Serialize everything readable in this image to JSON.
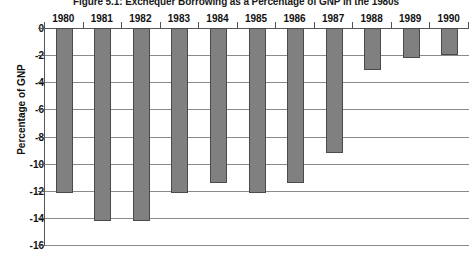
{
  "chart_data": {
    "type": "bar",
    "title": "Figure 5.1: Exchequer Borrowing as a Percentage of GNP in the 1980s",
    "xlabel": "",
    "ylabel": "Percentage of GNP",
    "categories": [
      "1980",
      "1981",
      "1982",
      "1983",
      "1984",
      "1985",
      "1986",
      "1987",
      "1988",
      "1989",
      "1990"
    ],
    "values": [
      -12.2,
      -14.2,
      -14.2,
      -12.2,
      -11.4,
      -12.2,
      -11.4,
      -9.2,
      -3.1,
      -2.2,
      -2.0
    ],
    "ylim": [
      -16,
      0
    ],
    "ytick_labels": [
      "0",
      "-2",
      "-4",
      "-6",
      "-8",
      "-10",
      "-12",
      "-14",
      "-16"
    ],
    "ytick_values": [
      0,
      -2,
      -4,
      -6,
      -8,
      -10,
      -12,
      -14,
      -16
    ],
    "grid": true,
    "legend": "none",
    "xaxis_position": "top",
    "bar_color": "#808080",
    "bar_border_color": "#4a4a4a",
    "gridline_color": "#8a8a8a",
    "axis_color": "#555555"
  }
}
